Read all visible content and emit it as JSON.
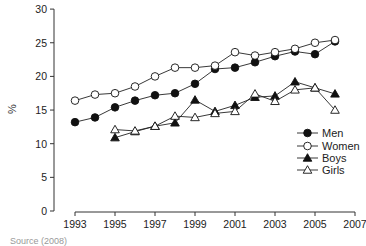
{
  "chart_data": {
    "type": "line",
    "title": "",
    "xlabel": "",
    "ylabel": "%",
    "x": [
      1993,
      1994,
      1995,
      1996,
      1997,
      1998,
      1999,
      2000,
      2001,
      2002,
      2003,
      2004,
      2005,
      2006
    ],
    "xticks": [
      1993,
      1995,
      1997,
      1999,
      2001,
      2003,
      2005,
      2007
    ],
    "yticks": [
      0,
      5,
      10,
      15,
      20,
      25,
      30
    ],
    "xlim": [
      1993,
      2007
    ],
    "ylim": [
      0,
      30
    ],
    "grid": false,
    "legend_position": "right-middle",
    "series": [
      {
        "name": "Men",
        "marker": "filled-circle",
        "x": [
          1993,
          1994,
          1995,
          1996,
          1997,
          1998,
          1999,
          2000,
          2001,
          2002,
          2003,
          2004,
          2005,
          2006
        ],
        "values": [
          13.2,
          13.9,
          15.4,
          16.4,
          17.2,
          17.5,
          18.9,
          21.1,
          21.3,
          22.1,
          23.0,
          23.7,
          23.3,
          25.2
        ]
      },
      {
        "name": "Women",
        "marker": "open-circle",
        "x": [
          1993,
          1994,
          1995,
          1996,
          1997,
          1998,
          1999,
          2000,
          2001,
          2002,
          2003,
          2004,
          2005,
          2006
        ],
        "values": [
          16.4,
          17.3,
          17.5,
          18.5,
          20.0,
          21.3,
          21.3,
          21.6,
          23.6,
          23.1,
          23.6,
          24.1,
          25.0,
          25.4
        ]
      },
      {
        "name": "Boys",
        "marker": "filled-triangle",
        "x": [
          1995,
          1996,
          1997,
          1998,
          1999,
          2000,
          2001,
          2002,
          2003,
          2004,
          2005,
          2006
        ],
        "values": [
          10.9,
          11.8,
          12.6,
          13.1,
          16.5,
          14.8,
          15.7,
          16.9,
          17.1,
          19.2,
          18.3,
          17.4
        ]
      },
      {
        "name": "Girls",
        "marker": "open-triangle",
        "x": [
          1995,
          1996,
          1997,
          1998,
          1999,
          2000,
          2001,
          2002,
          2003,
          2004,
          2005,
          2006
        ],
        "values": [
          12.1,
          11.9,
          12.6,
          14.1,
          13.9,
          14.5,
          14.8,
          17.4,
          16.3,
          18.0,
          18.3,
          15.0
        ]
      }
    ]
  },
  "source_note": "Source (2008)"
}
